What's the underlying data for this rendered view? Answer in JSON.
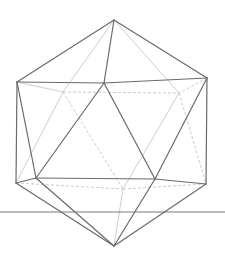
{
  "figure": {
    "title": "",
    "shape": "icosahedron",
    "style": "wireframe with hidden edges",
    "colors": {
      "visible_edge": "#6a6a6a",
      "hidden_edge": "#c8c8c8",
      "ground_line": "#7a7a7a",
      "background": "#ffffff"
    },
    "vertices": {
      "top": [
        114,
        20
      ],
      "upper_left": [
        17,
        82
      ],
      "upper_front": [
        104,
        83
      ],
      "upper_right": [
        207,
        78
      ],
      "upper_back_left": [
        63,
        92
      ],
      "upper_back_right": [
        179,
        93
      ],
      "lower_left": [
        16,
        183
      ],
      "lower_front_left": [
        36,
        178
      ],
      "lower_front_right": [
        155,
        179
      ],
      "lower_right": [
        206,
        184
      ],
      "lower_back": [
        123,
        189
      ],
      "bottom": [
        114,
        246
      ]
    },
    "ground_line": {
      "y": 212,
      "x1": 0,
      "x2": 225
    }
  }
}
